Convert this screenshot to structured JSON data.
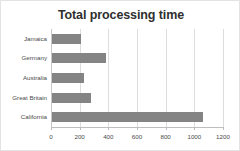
{
  "chart_data": {
    "type": "bar",
    "orientation": "horizontal",
    "title": "Total processing time",
    "xlabel": "",
    "ylabel": "",
    "categories": [
      "Jamaica",
      "Germany",
      "Australia",
      "Great Britain",
      "California"
    ],
    "values": [
      200,
      375,
      220,
      270,
      1050
    ],
    "xlim": [
      0,
      1200
    ],
    "xticks": [
      0,
      200,
      400,
      600,
      800,
      1000,
      1200
    ],
    "xtick_labels": [
      "0",
      "200",
      "400",
      "600",
      "800",
      "1000",
      "1200"
    ],
    "grid": true,
    "legend": false,
    "bar_color": "#848484",
    "gridline_color": "#dddddd",
    "title_color": "#2f2f2f",
    "axis_text_color": "#4a4a4a",
    "frame_border_color": "#e3e3e3"
  }
}
